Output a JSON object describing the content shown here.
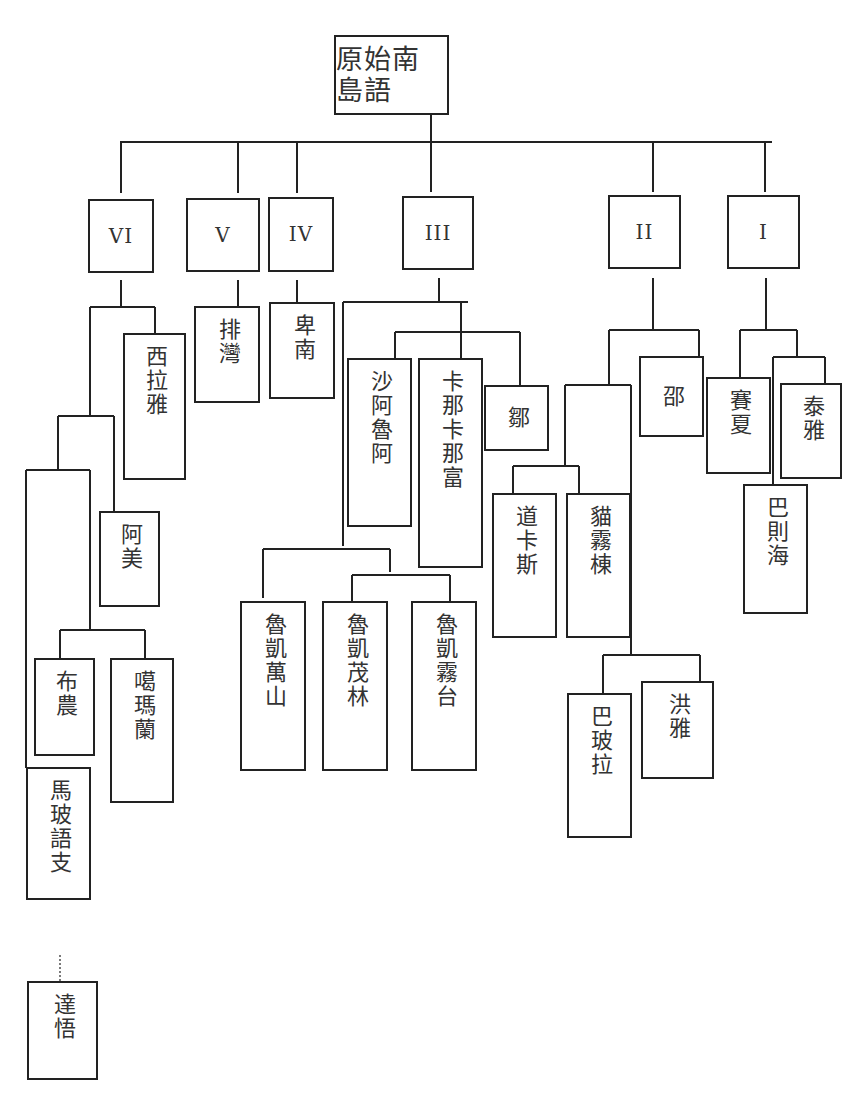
{
  "diagram": {
    "title": "原始南島語",
    "root": {
      "id": "root",
      "label": "原始南島語"
    },
    "groups": [
      {
        "id": "VI",
        "label": "VI"
      },
      {
        "id": "V",
        "label": "V"
      },
      {
        "id": "IV",
        "label": "IV"
      },
      {
        "id": "III",
        "label": "III"
      },
      {
        "id": "II",
        "label": "II"
      },
      {
        "id": "I",
        "label": "I"
      }
    ],
    "languages": {
      "siraya": "西拉雅",
      "amis": "阿美",
      "bunun": "布農",
      "kavalan": "噶瑪蘭",
      "mabotaai": "馬玻語支",
      "yami": "達悟",
      "paiwan": "排灣",
      "puyuma": "卑南",
      "saaroa": "沙阿魯阿",
      "kanakanavu": "卡那卡那富",
      "tsou": "鄒",
      "rukai_mantauran": "魯凱萬山",
      "rukai_maolin": "魯凱茂林",
      "rukai_budai": "魯凱霧台",
      "taokas": "道卡斯",
      "babuza": "貓霧棟",
      "thao": "邵",
      "papora": "巴玻拉",
      "hoanya": "洪雅",
      "saisiyat": "賽夏",
      "atayal": "泰雅",
      "pazeh": "巴則海"
    },
    "tree": {
      "root": [
        "VI",
        "V",
        "IV",
        "III",
        "II",
        "I"
      ],
      "VI": [
        "西拉雅",
        [
          "阿美",
          [
            [
              "布農",
              "噶瑪蘭"
            ],
            "馬玻語支"
          ]
        ]
      ],
      "V": [
        "排灣"
      ],
      "IV": [
        "卑南"
      ],
      "III": [
        [
          "沙阿魯阿",
          "卡那卡那富",
          "鄒"
        ],
        [
          "魯凱萬山",
          [
            "魯凱茂林",
            "魯凱霧台"
          ]
        ]
      ],
      "II": [
        [
          [
            "道卡斯",
            "貓霧棟"
          ],
          [
            "巴玻拉",
            "洪雅"
          ]
        ],
        "邵"
      ],
      "I": [
        "賽夏",
        [
          "泰雅",
          "巴則海"
        ]
      ],
      "dotted_link": [
        "馬玻語支",
        "達悟"
      ]
    }
  }
}
